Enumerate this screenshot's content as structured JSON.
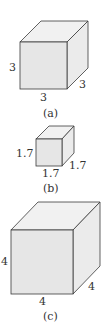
{
  "colors": {
    "front": "#e6e6e6",
    "top": "#f1f1f1",
    "side": "#ebebeb",
    "stroke": "#3a3a3a",
    "text": "#333333"
  },
  "cubes": [
    {
      "id": "a",
      "caption": "(a)",
      "edge_left": "3",
      "edge_bottom": "3",
      "edge_depth": "3"
    },
    {
      "id": "b",
      "caption": "(b)",
      "edge_left": "1.7",
      "edge_bottom": "1.7",
      "edge_depth": "1.7"
    },
    {
      "id": "c",
      "caption": "(c)",
      "edge_left": "4",
      "edge_bottom": "4",
      "edge_depth": "4"
    }
  ]
}
